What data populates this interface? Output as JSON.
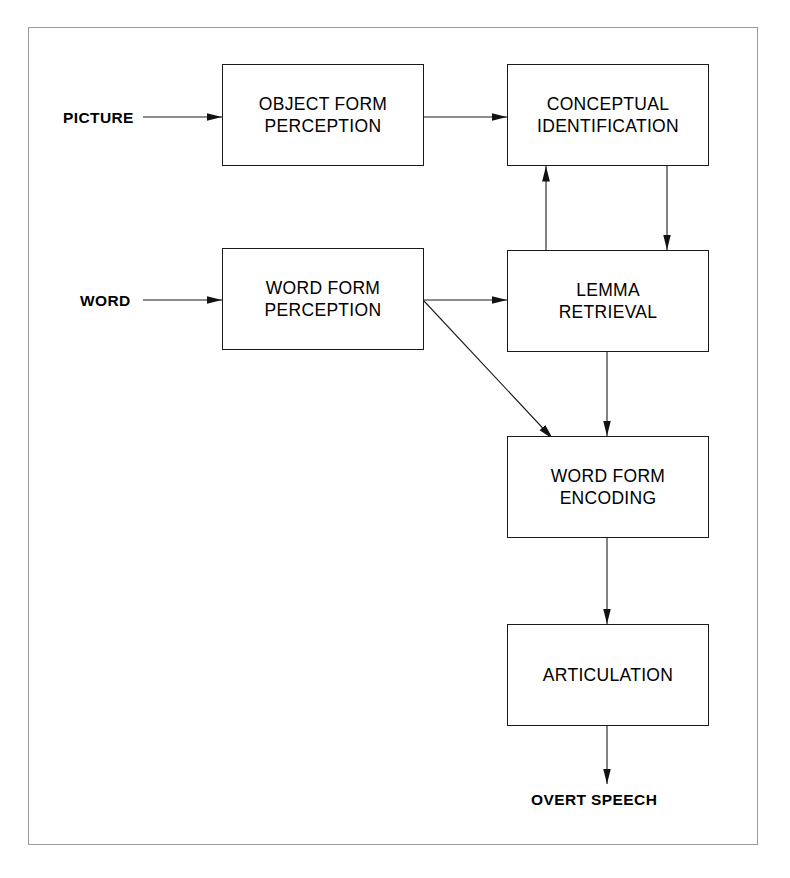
{
  "figure": {
    "type": "flow-diagram",
    "title": "",
    "frame": {
      "border_color": "#9a9a9a",
      "background": "#ffffff"
    },
    "line_color": "#1a1a1a",
    "box_border_color": "#1a1a1a",
    "box_fill": "#ffffff"
  },
  "nodes": [
    {
      "id": "object-form-perception",
      "label": "OBJECT  FORM\nPERCEPTION",
      "x": 222,
      "y": 64,
      "w": 202,
      "h": 102
    },
    {
      "id": "conceptual-identification",
      "label": "CONCEPTUAL\nIDENTIFICATION",
      "x": 507,
      "y": 64,
      "w": 202,
      "h": 102
    },
    {
      "id": "word-form-perception",
      "label": "WORD  FORM\nPERCEPTION",
      "x": 222,
      "y": 248,
      "w": 202,
      "h": 102
    },
    {
      "id": "lemma-retrieval",
      "label": "LEMMA\nRETRIEVAL",
      "x": 507,
      "y": 250,
      "w": 202,
      "h": 102
    },
    {
      "id": "word-form-encoding",
      "label": "WORD  FORM\nENCODING",
      "x": 507,
      "y": 436,
      "w": 202,
      "h": 102
    },
    {
      "id": "articulation",
      "label": "ARTICULATION",
      "x": 507,
      "y": 624,
      "w": 202,
      "h": 102
    }
  ],
  "io_labels": [
    {
      "id": "picture-input",
      "label": "PICTURE",
      "x": 63,
      "y": 109
    },
    {
      "id": "word-input",
      "label": "WORD",
      "x": 80,
      "y": 292
    },
    {
      "id": "overt-speech-output",
      "label": "OVERT SPEECH",
      "x": 531,
      "y": 791
    }
  ],
  "edges": [
    {
      "id": "picture-to-object-form-perception",
      "from": "PICTURE",
      "to": "OBJECT FORM PERCEPTION",
      "direction": "right"
    },
    {
      "id": "object-form-perception-to-conceptual",
      "from": "OBJECT FORM PERCEPTION",
      "to": "CONCEPTUAL IDENTIFICATION",
      "direction": "right"
    },
    {
      "id": "word-to-word-form-perception",
      "from": "WORD",
      "to": "WORD FORM PERCEPTION",
      "direction": "right"
    },
    {
      "id": "word-form-perception-to-lemma-retrieval",
      "from": "WORD FORM PERCEPTION",
      "to": "LEMMA RETRIEVAL",
      "direction": "right"
    },
    {
      "id": "word-form-perception-to-word-form-encoding",
      "from": "WORD FORM PERCEPTION",
      "to": "WORD FORM ENCODING",
      "direction": "diagonal-down-right"
    },
    {
      "id": "lemma-retrieval-to-conceptual",
      "from": "LEMMA RETRIEVAL",
      "to": "CONCEPTUAL IDENTIFICATION",
      "direction": "up"
    },
    {
      "id": "conceptual-to-lemma-retrieval",
      "from": "CONCEPTUAL IDENTIFICATION",
      "to": "LEMMA RETRIEVAL",
      "direction": "down"
    },
    {
      "id": "lemma-retrieval-to-word-form-encoding",
      "from": "LEMMA RETRIEVAL",
      "to": "WORD FORM ENCODING",
      "direction": "down"
    },
    {
      "id": "word-form-encoding-to-articulation",
      "from": "WORD FORM ENCODING",
      "to": "ARTICULATION",
      "direction": "down"
    },
    {
      "id": "articulation-to-overt-speech",
      "from": "ARTICULATION",
      "to": "OVERT SPEECH",
      "direction": "down"
    }
  ]
}
